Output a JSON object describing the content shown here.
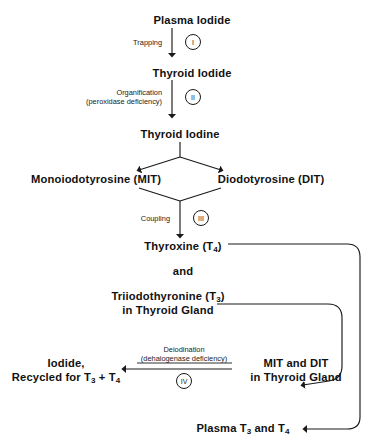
{
  "diagram": {
    "type": "flowchart",
    "background_color": "#ffffff",
    "line_color": "#1a1a1a",
    "text_color": "#111111"
  },
  "nodes": {
    "plasma_iodide": "Plasma Iodide",
    "thyroid_iodide": "Thyroid Iodide",
    "thyroid_iodine": "Thyroid Iodine",
    "mit": "Monoiodotyrosine (MIT)",
    "dit": "Diodotyrosine (DIT)",
    "thyroxine_t4": "Thyroxine (T",
    "thyroxine_t4_sub": "4",
    "thyroxine_t4_end": ")",
    "and": "and",
    "triiodothyronine_t3": "Triiodothyronine (T",
    "triiodothyronine_t3_sub": "3",
    "triiodothyronine_t3_end": ")",
    "in_thyroid_gland": "in Thyroid Gland",
    "iodide_line1": "Iodide,",
    "iodide_line2_a": "Recycled for T",
    "iodide_line2_sub1": "3",
    "iodide_line2_b": " + T",
    "iodide_line2_sub2": "4",
    "mit_and_dit": "MIT and DIT",
    "mit_dit_in_gland": "in Thyroid Gland",
    "plasma_t3_t4_a": "Plasma T",
    "plasma_t3_t4_sub1": "3",
    "plasma_t3_t4_b": " and T",
    "plasma_t3_t4_sub2": "4"
  },
  "steps": [
    {
      "id": "step-1",
      "numeral": "I",
      "label": "Trapping",
      "label_lines": [
        "Trapping"
      ]
    },
    {
      "id": "step-2",
      "numeral": "II",
      "label": "Organification (peroxidase deficiency)",
      "label_lines": [
        "Organification",
        "(peroxidase deficiency)"
      ]
    },
    {
      "id": "step-3",
      "numeral": "III",
      "label": "Coupling",
      "label_lines": [
        "Coupling"
      ]
    },
    {
      "id": "step-4",
      "numeral": "IV",
      "label": "Deiodination (dehalogenase deficiency)",
      "label_lines": [
        "Deiodination",
        "(dehalogenase deficiency)"
      ]
    }
  ]
}
